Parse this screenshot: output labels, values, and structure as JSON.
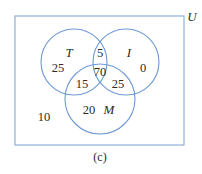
{
  "diagram": {
    "type": "venn-3-set",
    "caption": "(c)",
    "universe": {
      "label": "U"
    },
    "sets": [
      {
        "id": "T",
        "label": "T"
      },
      {
        "id": "I",
        "label": "I"
      },
      {
        "id": "M",
        "label": "M"
      }
    ],
    "regions": {
      "T_only": "25",
      "I_only": "0",
      "M_only": "20",
      "T_and_I_only": "5",
      "T_and_M_only": "15",
      "I_and_M_only": "25",
      "T_and_I_and_M": "70",
      "outside": "10"
    },
    "colors": {
      "outline": "#8fb0d8",
      "text": "#2b2b2b"
    }
  }
}
